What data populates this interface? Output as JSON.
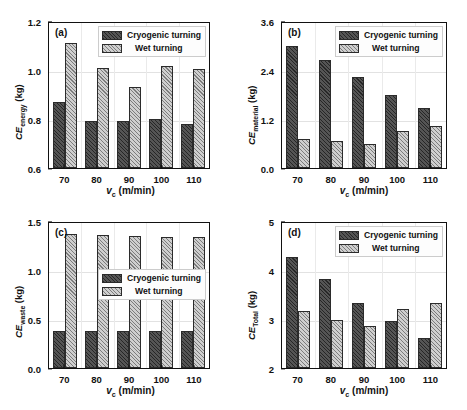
{
  "figure": {
    "series_names": [
      "Cryogenic turning",
      "Wet turning"
    ],
    "colors": {
      "cryogenic": "#555555",
      "wet": "#cfcfcf",
      "axis": "#111111",
      "grid": "#e2e2e2"
    },
    "xlabel_main": "v",
    "xlabel_sub": "c",
    "xlabel_unit": " (m/min)",
    "categories": [
      "70",
      "80",
      "90",
      "100",
      "110"
    ]
  },
  "chart_data": [
    {
      "type": "bar",
      "panel": "(a)",
      "title": "",
      "xlabel": "v_c (m/min)",
      "ylabel": "CE_energy (kg)",
      "ylabel_main": "CE",
      "ylabel_sub": "energy",
      "ylabel_unit": " (kg)",
      "categories": [
        "70",
        "80",
        "90",
        "100",
        "110"
      ],
      "yticks": [
        "0.6",
        "0.8",
        "1.0",
        "1.2"
      ],
      "ylim": [
        0.6,
        1.2
      ],
      "grid": true,
      "legend_position": "top-right",
      "series": [
        {
          "name": "Cryogenic turning",
          "values": [
            0.87,
            0.79,
            0.79,
            0.8,
            0.78
          ]
        },
        {
          "name": "Wet turning",
          "values": [
            1.11,
            1.01,
            0.93,
            1.015,
            1.005
          ]
        }
      ]
    },
    {
      "type": "bar",
      "panel": "(b)",
      "title": "",
      "xlabel": "v_c (m/min)",
      "ylabel": "CE_material (kg)",
      "ylabel_main": "CE",
      "ylabel_sub": "material",
      "ylabel_unit": " (kg)",
      "categories": [
        "70",
        "80",
        "90",
        "100",
        "110"
      ],
      "yticks": [
        "0.0",
        "1.2",
        "2.4",
        "3.6"
      ],
      "ylim": [
        0.0,
        3.6
      ],
      "grid": true,
      "legend_position": "top-right",
      "series": [
        {
          "name": "Cryogenic turning",
          "values": [
            3.0,
            2.64,
            2.22,
            1.8,
            1.46
          ]
        },
        {
          "name": "Wet turning",
          "values": [
            0.72,
            0.66,
            0.6,
            0.9,
            1.02
          ]
        }
      ]
    },
    {
      "type": "bar",
      "panel": "(c)",
      "title": "",
      "xlabel": "v_c (m/min)",
      "ylabel": "CE_waste (kg)",
      "ylabel_main": "CE",
      "ylabel_sub": "waste",
      "ylabel_unit": " (kg)",
      "categories": [
        "70",
        "80",
        "90",
        "100",
        "110"
      ],
      "yticks": [
        "0.0",
        "0.5",
        "1.0",
        "1.5"
      ],
      "ylim": [
        0.0,
        1.5
      ],
      "grid": true,
      "legend_position": "middle-right",
      "series": [
        {
          "name": "Cryogenic turning",
          "values": [
            0.375,
            0.375,
            0.375,
            0.375,
            0.375
          ]
        },
        {
          "name": "Wet turning",
          "values": [
            1.365,
            1.355,
            1.35,
            1.34,
            1.335
          ]
        }
      ]
    },
    {
      "type": "bar",
      "panel": "(d)",
      "title": "",
      "xlabel": "v_c (m/min)",
      "ylabel": "CE_Total (kg)",
      "ylabel_main": "CE",
      "ylabel_sub": "Total",
      "ylabel_unit": " (kg)",
      "categories": [
        "70",
        "80",
        "90",
        "100",
        "110"
      ],
      "yticks": [
        "2",
        "3",
        "4",
        "5"
      ],
      "ylim": [
        2,
        5
      ],
      "grid": true,
      "legend_position": "top-right",
      "series": [
        {
          "name": "Cryogenic turning",
          "values": [
            4.27,
            3.81,
            3.32,
            2.96,
            2.62
          ]
        },
        {
          "name": "Wet turning",
          "values": [
            3.17,
            2.99,
            2.85,
            3.2,
            3.33
          ]
        }
      ]
    }
  ]
}
